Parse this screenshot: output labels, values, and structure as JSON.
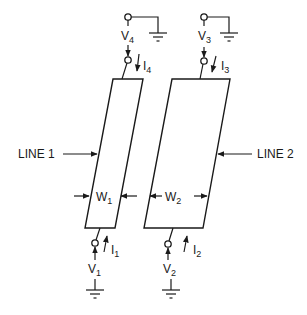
{
  "diagram": {
    "type": "coupled-transmission-lines-schematic",
    "labels": {
      "line1": "LINE 1",
      "line2": "LINE 2",
      "w1": {
        "main": "W",
        "sub": "1"
      },
      "w2": {
        "main": "W",
        "sub": "2"
      },
      "v1": {
        "main": "V",
        "sub": "1"
      },
      "v2": {
        "main": "V",
        "sub": "2"
      },
      "v3": {
        "main": "V",
        "sub": "3"
      },
      "v4": {
        "main": "V",
        "sub": "4"
      },
      "i1": {
        "main": "I",
        "sub": "1"
      },
      "i2": {
        "main": "I",
        "sub": "2"
      },
      "i3": {
        "main": "I",
        "sub": "3"
      },
      "i4": {
        "main": "I",
        "sub": "4"
      }
    },
    "ports": [
      {
        "id": "port-1",
        "voltage": "V1",
        "current": "I1",
        "end": "bottom",
        "line": "LINE 1",
        "current_direction": "up"
      },
      {
        "id": "port-2",
        "voltage": "V2",
        "current": "I2",
        "end": "bottom",
        "line": "LINE 2",
        "current_direction": "up"
      },
      {
        "id": "port-3",
        "voltage": "V3",
        "current": "I3",
        "end": "top",
        "line": "LINE 2",
        "current_direction": "down"
      },
      {
        "id": "port-4",
        "voltage": "V4",
        "current": "I4",
        "end": "top",
        "line": "LINE 1",
        "current_direction": "down"
      }
    ],
    "colors": {
      "ink": "#1a1a1a",
      "background": "#ffffff"
    }
  }
}
